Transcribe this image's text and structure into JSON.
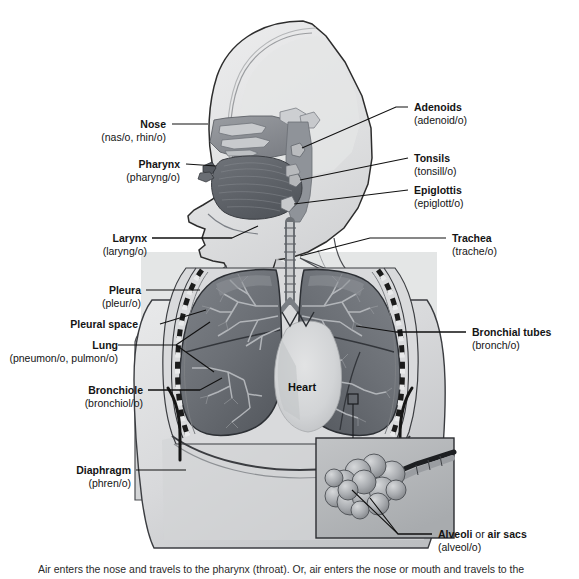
{
  "figure": {
    "heart_label": "Heart",
    "caption": "Air enters the nose and travels to the pharynx (throat). Or, air enters the nose or mouth and travels to the"
  },
  "labels": {
    "nose": {
      "term": "Nose",
      "combining": "(nas/o, rhin/o)"
    },
    "pharynx": {
      "term": "Pharynx",
      "combining": "(pharyng/o)"
    },
    "larynx": {
      "term": "Larynx",
      "combining": "(laryng/o)"
    },
    "pleura": {
      "term": "Pleura",
      "combining": "(pleur/o)"
    },
    "pleural_space": {
      "term": "Pleural space",
      "combining": ""
    },
    "lung": {
      "term": "Lung",
      "combining": "(pneumon/o, pulmon/o)"
    },
    "bronchiole": {
      "term": "Bronchiole",
      "combining": "(bronchiol/o)"
    },
    "diaphragm": {
      "term": "Diaphragm",
      "combining": "(phren/o)"
    },
    "adenoids": {
      "term": "Adenoids",
      "combining": "(adenoid/o)"
    },
    "tonsils": {
      "term": "Tonsils",
      "combining": "(tonsill/o)"
    },
    "epiglottis": {
      "term": "Epiglottis",
      "combining": "(epiglott/o)"
    },
    "trachea": {
      "term": "Trachea",
      "combining": "(trache/o)"
    },
    "bronchial_tubes": {
      "term": "Bronchial tubes",
      "combining": "(bronch/o)"
    },
    "alveoli": {
      "term": "Alveoli",
      "term_mid": " or ",
      "term_end": "air sacs",
      "combining": "(alveol/o)"
    }
  },
  "colors": {
    "line": "#111111",
    "text": "#141414",
    "lung_fill": "#6e7278",
    "lung_fill_dark": "#5b5f66",
    "body_fill": "#dfe0e1",
    "body_fill_dark": "#c3c5c7",
    "panel_tint": "#e4e5e6",
    "inset_fill": "#b9bbbd",
    "alveoli_fill": "#9a9da1",
    "background": "#ffffff",
    "pleura_dash": "#1b1b1b"
  }
}
